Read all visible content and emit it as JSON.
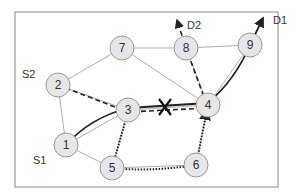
{
  "diagram": {
    "frame": {
      "x": 15,
      "y": 12,
      "w": 263,
      "h": 175,
      "stroke": "#888888"
    },
    "node_fill": "#e6e6e6",
    "node_stroke": "#999999",
    "nodes": [
      {
        "id": "1",
        "label": "1",
        "x": 66,
        "y": 145
      },
      {
        "id": "2",
        "label": "2",
        "x": 58,
        "y": 85
      },
      {
        "id": "3",
        "label": "3",
        "x": 128,
        "y": 110
      },
      {
        "id": "4",
        "label": "4",
        "x": 208,
        "y": 105
      },
      {
        "id": "5",
        "label": "5",
        "x": 112,
        "y": 168
      },
      {
        "id": "6",
        "label": "6",
        "x": 196,
        "y": 165
      },
      {
        "id": "7",
        "label": "7",
        "x": 122,
        "y": 48
      },
      {
        "id": "8",
        "label": "8",
        "x": 186,
        "y": 48
      },
      {
        "id": "9",
        "label": "9",
        "x": 250,
        "y": 45
      }
    ],
    "edges": [
      [
        "1",
        "2"
      ],
      [
        "1",
        "3"
      ],
      [
        "1",
        "5"
      ],
      [
        "2",
        "3"
      ],
      [
        "2",
        "7"
      ],
      [
        "3",
        "4"
      ],
      [
        "3",
        "5"
      ],
      [
        "4",
        "6"
      ],
      [
        "4",
        "7"
      ],
      [
        "4",
        "8"
      ],
      [
        "4",
        "9"
      ],
      [
        "5",
        "6"
      ],
      [
        "7",
        "8"
      ],
      [
        "8",
        "9"
      ]
    ],
    "labels": {
      "s1": "S1",
      "s2": "S2",
      "d1": "D1",
      "d2": "D2",
      "failure_mark": "X"
    },
    "paths": [
      {
        "name": "S1 to D1 primary (solid)",
        "style": "solid",
        "nodes": [
          "1",
          "3",
          "4",
          "9",
          "D1"
        ]
      },
      {
        "name": "S2 to D2 (dashed)",
        "style": "dashed",
        "nodes": [
          "2",
          "3",
          "4",
          "8",
          "D2"
        ]
      },
      {
        "name": "backup (dotted)",
        "style": "dotted",
        "nodes": [
          "3",
          "5",
          "6",
          "4"
        ]
      }
    ]
  }
}
